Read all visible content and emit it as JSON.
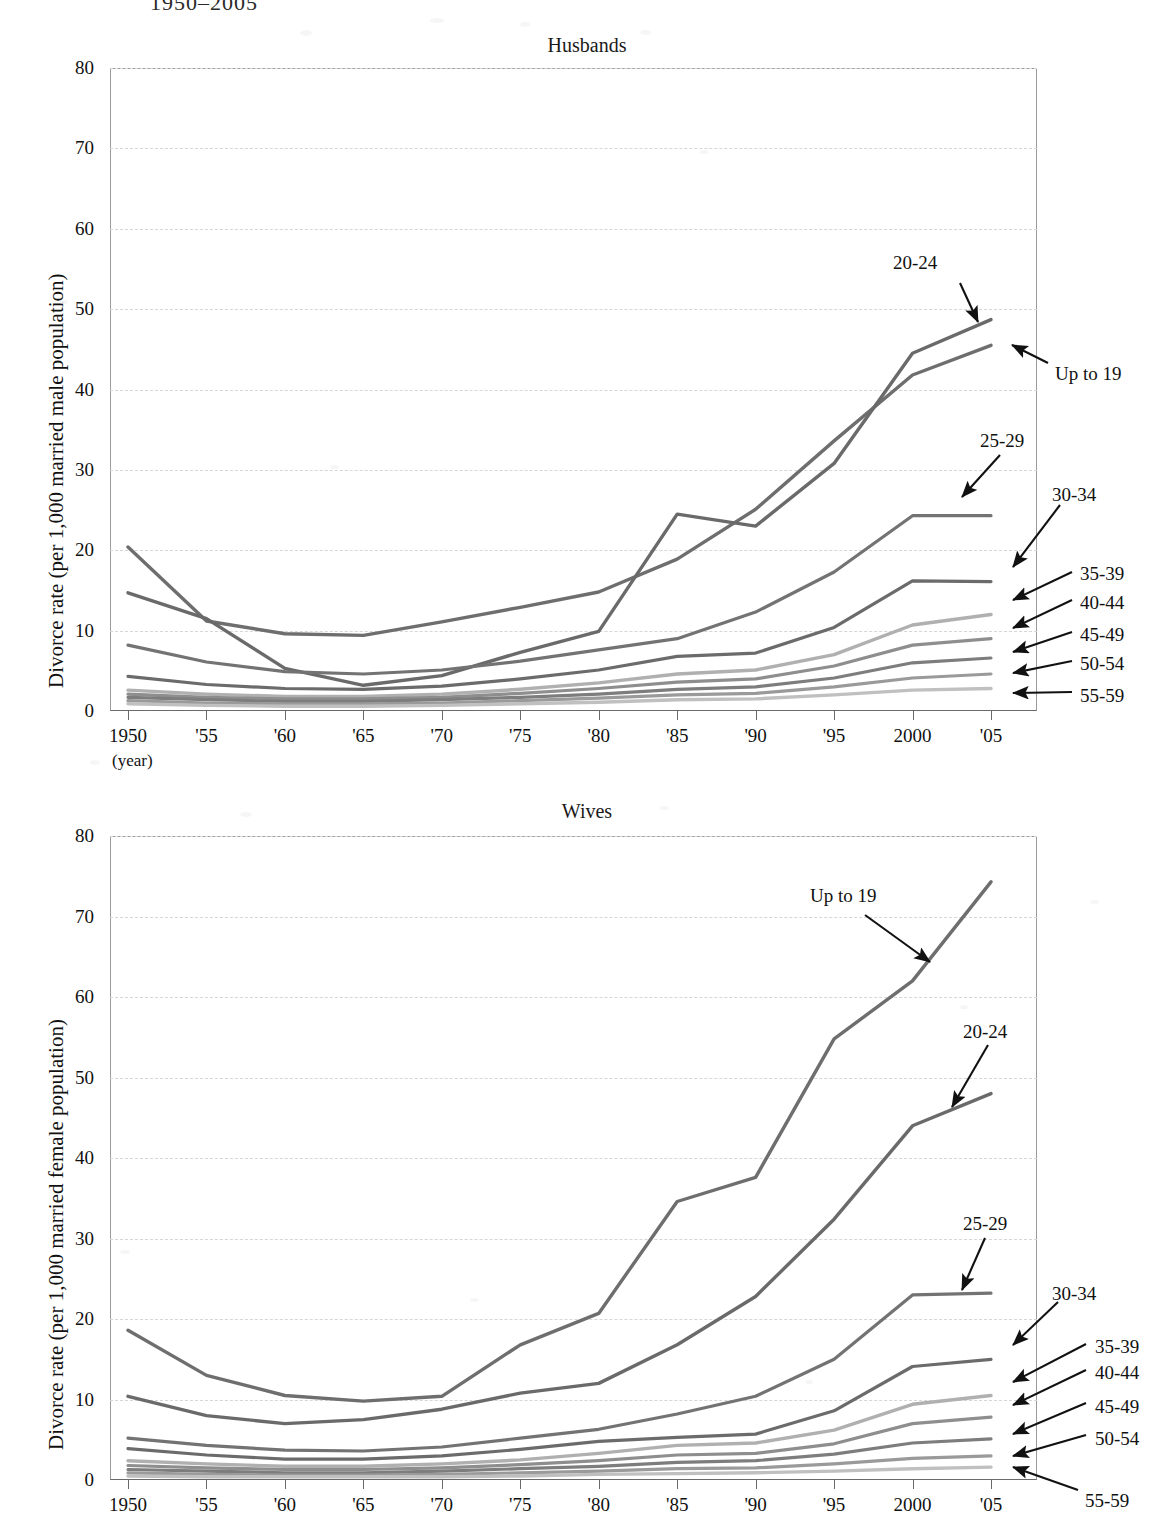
{
  "document": {
    "title_partial": "1950–2005"
  },
  "yaxis": {
    "ticks": [
      0,
      10,
      20,
      30,
      40,
      50,
      60,
      70,
      80
    ],
    "min": 0,
    "max": 80
  },
  "xaxis": {
    "ticks": [
      "1950",
      "'55",
      "'60",
      "'65",
      "'70",
      "'75",
      "'80",
      "'85",
      "'90",
      "'95",
      "2000",
      "'05"
    ],
    "unit_note": "(year)"
  },
  "colors": {
    "frame": "#9a9a9a",
    "grid": "#d6d6d6",
    "series": [
      "#6e6e6e",
      "#6a6a6a",
      "#737373",
      "#6b6b6b",
      "#b0b0b0",
      "#8e8e8e",
      "#7d7d7d",
      "#9a9a9a",
      "#c0c0c0"
    ]
  },
  "chart_data": [
    {
      "type": "line",
      "title": "Husbands",
      "xlabel": "(year)",
      "ylabel": "Divorce rate (per 1,000 married male population)",
      "x": [
        1950,
        1955,
        1960,
        1965,
        1970,
        1975,
        1980,
        1985,
        1990,
        1995,
        2000,
        2005
      ],
      "ylim": [
        0,
        80
      ],
      "grid": true,
      "legend": "arrow-annotations-right",
      "series": [
        {
          "name": "Up to 19",
          "values": [
            20.4,
            11.2,
            9.6,
            9.4,
            11.1,
            12.9,
            14.8,
            18.9,
            25.1,
            33.6,
            41.8,
            45.5
          ]
        },
        {
          "name": "20-24",
          "values": [
            14.7,
            11.5,
            5.3,
            3.2,
            4.4,
            7.3,
            9.9,
            24.5,
            23.0,
            30.8,
            44.5,
            48.7
          ]
        },
        {
          "name": "25-29",
          "values": [
            8.2,
            6.1,
            4.9,
            4.6,
            5.1,
            6.2,
            7.6,
            9.0,
            12.3,
            17.3,
            24.3,
            24.3
          ]
        },
        {
          "name": "30-34",
          "values": [
            4.3,
            3.3,
            2.8,
            2.7,
            3.1,
            4.0,
            5.1,
            6.8,
            7.2,
            10.4,
            16.2,
            16.1
          ]
        },
        {
          "name": "35-39",
          "values": [
            2.6,
            2.1,
            1.8,
            1.8,
            2.1,
            2.7,
            3.5,
            4.6,
            5.1,
            7.0,
            10.7,
            12.0
          ]
        },
        {
          "name": "40-44",
          "values": [
            2.1,
            1.7,
            1.5,
            1.5,
            1.7,
            2.2,
            2.8,
            3.6,
            4.0,
            5.6,
            8.2,
            9.0
          ]
        },
        {
          "name": "45-49",
          "values": [
            1.7,
            1.4,
            1.2,
            1.2,
            1.4,
            1.7,
            2.1,
            2.7,
            3.0,
            4.1,
            6.0,
            6.6
          ]
        },
        {
          "name": "50-54",
          "values": [
            1.3,
            1.0,
            0.9,
            0.9,
            1.0,
            1.3,
            1.6,
            2.0,
            2.2,
            3.0,
            4.1,
            4.6
          ]
        },
        {
          "name": "55-59",
          "values": [
            0.9,
            0.7,
            0.6,
            0.6,
            0.7,
            0.9,
            1.1,
            1.4,
            1.5,
            2.0,
            2.6,
            2.8
          ]
        }
      ],
      "annotations": [
        {
          "label": "20-24"
        },
        {
          "label": "Up to 19"
        },
        {
          "label": "25-29"
        },
        {
          "label": "30-34"
        },
        {
          "label": "35-39"
        },
        {
          "label": "40-44"
        },
        {
          "label": "45-49"
        },
        {
          "label": "50-54"
        },
        {
          "label": "55-59"
        }
      ]
    },
    {
      "type": "line",
      "title": "Wives",
      "xlabel": "(year)",
      "ylabel": "Divorce rate (per 1,000 married female population)",
      "x": [
        1950,
        1955,
        1960,
        1965,
        1970,
        1975,
        1980,
        1985,
        1990,
        1995,
        2000,
        2005
      ],
      "ylim": [
        0,
        80
      ],
      "grid": true,
      "legend": "arrow-annotations-right",
      "series": [
        {
          "name": "Up to 19",
          "values": [
            18.6,
            13.0,
            10.5,
            9.8,
            10.4,
            16.8,
            20.7,
            34.6,
            37.6,
            54.8,
            62.0,
            74.3
          ]
        },
        {
          "name": "20-24",
          "values": [
            10.4,
            8.0,
            7.0,
            7.5,
            8.8,
            10.8,
            12.0,
            16.8,
            22.8,
            32.4,
            44.0,
            48.0
          ]
        },
        {
          "name": "25-29",
          "values": [
            5.2,
            4.3,
            3.7,
            3.6,
            4.1,
            5.2,
            6.3,
            8.2,
            10.4,
            15.0,
            23.0,
            23.2
          ]
        },
        {
          "name": "30-34",
          "values": [
            3.9,
            3.1,
            2.6,
            2.6,
            3.0,
            3.8,
            4.8,
            5.3,
            5.7,
            8.6,
            14.1,
            15.0
          ]
        },
        {
          "name": "35-39",
          "values": [
            2.4,
            2.0,
            1.7,
            1.7,
            2.0,
            2.5,
            3.3,
            4.3,
            4.6,
            6.2,
            9.4,
            10.5
          ]
        },
        {
          "name": "40-44",
          "values": [
            1.8,
            1.5,
            1.3,
            1.3,
            1.5,
            1.9,
            2.4,
            3.1,
            3.3,
            4.5,
            7.0,
            7.8
          ]
        },
        {
          "name": "45-49",
          "values": [
            1.3,
            1.1,
            0.9,
            0.9,
            1.1,
            1.4,
            1.7,
            2.2,
            2.4,
            3.2,
            4.6,
            5.1
          ]
        },
        {
          "name": "50-54",
          "values": [
            0.9,
            0.7,
            0.6,
            0.6,
            0.7,
            0.9,
            1.1,
            1.4,
            1.5,
            2.0,
            2.7,
            3.0
          ]
        },
        {
          "name": "55-59",
          "values": [
            0.5,
            0.4,
            0.4,
            0.4,
            0.4,
            0.5,
            0.7,
            0.8,
            0.9,
            1.1,
            1.4,
            1.6
          ]
        }
      ],
      "annotations": [
        {
          "label": "Up to 19"
        },
        {
          "label": "20-24"
        },
        {
          "label": "25-29"
        },
        {
          "label": "30-34"
        },
        {
          "label": "35-39"
        },
        {
          "label": "40-44"
        },
        {
          "label": "45-49"
        },
        {
          "label": "50-54"
        },
        {
          "label": "55-59"
        }
      ]
    }
  ]
}
